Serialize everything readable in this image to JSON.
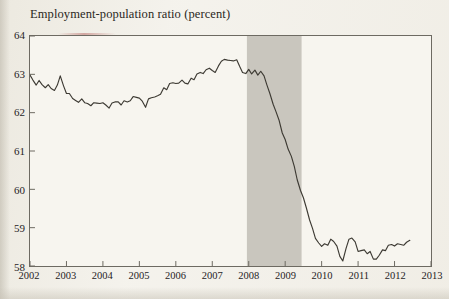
{
  "chart_data": {
    "type": "line",
    "title": "Employment-population ratio (percent)",
    "xlabel": "",
    "ylabel": "",
    "ylim": [
      58,
      64
    ],
    "xlim": [
      2002,
      2013
    ],
    "yticks": [
      58,
      59,
      60,
      61,
      62,
      63,
      64
    ],
    "xticks": [
      2002,
      2003,
      2004,
      2005,
      2006,
      2007,
      2008,
      2009,
      2010,
      2011,
      2012,
      2013
    ],
    "grid": false,
    "legend": null,
    "line_color": "#3d3a33",
    "shaded_region": {
      "label": "recession",
      "start": 2007.95,
      "end": 2009.45,
      "color": "#c9c6be"
    },
    "series": [
      {
        "name": "Employment-population ratio",
        "x": [
          2002.0,
          2002.08,
          2002.17,
          2002.25,
          2002.33,
          2002.42,
          2002.5,
          2002.58,
          2002.67,
          2002.75,
          2002.83,
          2002.92,
          2003.0,
          2003.08,
          2003.17,
          2003.25,
          2003.33,
          2003.42,
          2003.5,
          2003.58,
          2003.67,
          2003.75,
          2003.83,
          2003.92,
          2004.0,
          2004.08,
          2004.17,
          2004.25,
          2004.33,
          2004.42,
          2004.5,
          2004.58,
          2004.67,
          2004.75,
          2004.83,
          2004.92,
          2005.0,
          2005.08,
          2005.17,
          2005.25,
          2005.33,
          2005.42,
          2005.5,
          2005.58,
          2005.67,
          2005.75,
          2005.83,
          2005.92,
          2006.0,
          2006.08,
          2006.17,
          2006.25,
          2006.33,
          2006.42,
          2006.5,
          2006.58,
          2006.67,
          2006.75,
          2006.83,
          2006.92,
          2007.0,
          2007.08,
          2007.17,
          2007.25,
          2007.33,
          2007.42,
          2007.5,
          2007.58,
          2007.67,
          2007.75,
          2007.83,
          2007.92,
          2008.0,
          2008.08,
          2008.17,
          2008.25,
          2008.33,
          2008.42,
          2008.5,
          2008.58,
          2008.67,
          2008.75,
          2008.83,
          2008.92,
          2009.0,
          2009.08,
          2009.17,
          2009.25,
          2009.33,
          2009.42,
          2009.5,
          2009.58,
          2009.67,
          2009.75,
          2009.83,
          2009.92,
          2010.0,
          2010.08,
          2010.17,
          2010.25,
          2010.33,
          2010.42,
          2010.5,
          2010.58,
          2010.67,
          2010.75,
          2010.83,
          2010.92,
          2011.0,
          2011.08,
          2011.17,
          2011.25,
          2011.33,
          2011.42,
          2011.5,
          2011.58,
          2011.67,
          2011.75,
          2011.83,
          2011.92,
          2012.0,
          2012.08,
          2012.17,
          2012.25,
          2012.33,
          2012.42
        ],
        "values": [
          62.98,
          62.85,
          62.72,
          62.84,
          62.73,
          62.65,
          62.73,
          62.63,
          62.58,
          62.72,
          62.96,
          62.7,
          62.5,
          62.5,
          62.37,
          62.32,
          62.27,
          62.36,
          62.26,
          62.24,
          62.18,
          62.26,
          62.25,
          62.24,
          62.26,
          62.2,
          62.12,
          62.25,
          62.28,
          62.28,
          62.2,
          62.31,
          62.28,
          62.31,
          62.42,
          62.4,
          62.38,
          62.3,
          62.14,
          62.36,
          62.39,
          62.41,
          62.44,
          62.48,
          62.65,
          62.6,
          62.76,
          62.78,
          62.76,
          62.77,
          62.85,
          62.77,
          62.75,
          62.9,
          62.86,
          63.01,
          63.05,
          63.02,
          63.12,
          63.16,
          63.1,
          63.05,
          63.22,
          63.34,
          63.39,
          63.37,
          63.36,
          63.35,
          63.38,
          63.21,
          63.05,
          63.02,
          63.13,
          63.01,
          63.11,
          62.98,
          63.08,
          62.96,
          62.72,
          62.5,
          62.22,
          62.02,
          61.81,
          61.47,
          61.3,
          61.05,
          60.86,
          60.6,
          60.25,
          59.97,
          59.78,
          59.52,
          59.2,
          58.98,
          58.72,
          58.6,
          58.51,
          58.58,
          58.54,
          58.7,
          58.64,
          58.52,
          58.25,
          58.13,
          58.46,
          58.7,
          58.73,
          58.63,
          58.38,
          58.4,
          58.42,
          58.32,
          58.38,
          58.18,
          58.18,
          58.28,
          58.42,
          58.4,
          58.54,
          58.56,
          58.52,
          58.58,
          58.56,
          58.54,
          58.62,
          58.67
        ]
      }
    ]
  }
}
